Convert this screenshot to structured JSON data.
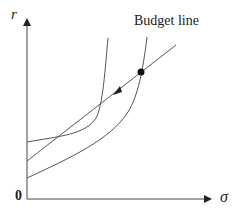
{
  "diagram": {
    "y_axis_label": "r",
    "x_axis_label": "σ",
    "origin_label": "0",
    "budget_line_label": "Budget line",
    "colors": {
      "line": "#555555",
      "axis": "#444444",
      "dot": "#111111"
    }
  }
}
